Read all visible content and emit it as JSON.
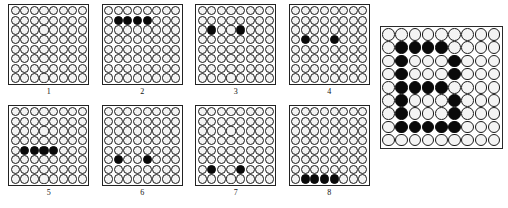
{
  "figure": {
    "title": "",
    "colors": {
      "filled": "#0a0a0a",
      "empty": "#f4f4f4",
      "outline": "#1a1a1a",
      "frame": "#222222",
      "background": "#ffffff"
    }
  },
  "small_panels": [
    {
      "label": "1",
      "rows": 8,
      "cols": 8,
      "filled_cells": []
    },
    {
      "label": "2",
      "rows": 8,
      "cols": 8,
      "filled_cells": [
        [
          1,
          1
        ],
        [
          1,
          2
        ],
        [
          1,
          3
        ],
        [
          1,
          4
        ]
      ]
    },
    {
      "label": "3",
      "rows": 8,
      "cols": 8,
      "filled_cells": [
        [
          2,
          1
        ],
        [
          2,
          4
        ]
      ]
    },
    {
      "label": "4",
      "rows": 8,
      "cols": 8,
      "filled_cells": [
        [
          3,
          1
        ],
        [
          3,
          4
        ]
      ]
    },
    {
      "label": "5",
      "rows": 8,
      "cols": 8,
      "filled_cells": [
        [
          4,
          1
        ],
        [
          4,
          2
        ],
        [
          4,
          3
        ],
        [
          4,
          4
        ]
      ]
    },
    {
      "label": "6",
      "rows": 8,
      "cols": 8,
      "filled_cells": [
        [
          5,
          1
        ],
        [
          5,
          4
        ]
      ]
    },
    {
      "label": "7",
      "rows": 8,
      "cols": 8,
      "filled_cells": [
        [
          6,
          1
        ],
        [
          6,
          4
        ]
      ]
    },
    {
      "label": "8",
      "rows": 8,
      "cols": 8,
      "filled_cells": [
        [
          7,
          1
        ],
        [
          7,
          2
        ],
        [
          7,
          3
        ],
        [
          7,
          4
        ]
      ]
    }
  ],
  "large_panel": {
    "label": "",
    "rows": 9,
    "cols": 9,
    "pattern_name": "letter-B",
    "filled_cells": [
      [
        1,
        1
      ],
      [
        1,
        2
      ],
      [
        1,
        3
      ],
      [
        1,
        4
      ],
      [
        2,
        1
      ],
      [
        2,
        5
      ],
      [
        3,
        1
      ],
      [
        3,
        5
      ],
      [
        4,
        1
      ],
      [
        4,
        2
      ],
      [
        4,
        3
      ],
      [
        4,
        4
      ],
      [
        5,
        1
      ],
      [
        5,
        5
      ],
      [
        6,
        1
      ],
      [
        6,
        5
      ],
      [
        7,
        1
      ],
      [
        7,
        2
      ],
      [
        7,
        3
      ],
      [
        7,
        4
      ],
      [
        7,
        5
      ]
    ]
  }
}
